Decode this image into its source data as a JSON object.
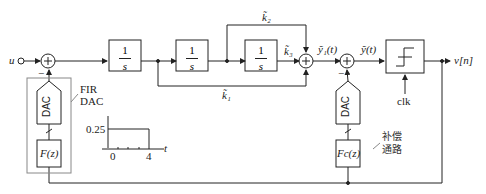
{
  "diagram": {
    "input_label": "u",
    "output_label": "v[n]",
    "integrator_label": {
      "num": "1",
      "den": "s"
    },
    "integrators": [
      {
        "id": "int1",
        "num": "1",
        "den": "s"
      },
      {
        "id": "int2",
        "num": "1",
        "den": "s"
      },
      {
        "id": "int3",
        "num": "1",
        "den": "s"
      }
    ],
    "gains": {
      "k1": "k̃₁",
      "k2": "k̃₂",
      "k3": "k̃₃"
    },
    "signals": {
      "y1": "ỹ₁(t)",
      "y": "ỹ(t)"
    },
    "quantizer_clock": "clk",
    "fir_dac_label": [
      "FIR",
      "DAC"
    ],
    "dac_label": "DAC",
    "filter_main": "F(z)",
    "filter_comp": "Fc(z)",
    "compensation_label": [
      "补偿",
      "通路"
    ],
    "minus_sign": "−",
    "pulse_plot": {
      "y_tick": "0.25",
      "x_ticks": [
        "0",
        "4"
      ],
      "x_label": "t"
    }
  },
  "colors": {
    "stroke": "#222222",
    "box_outline": "#888888"
  }
}
